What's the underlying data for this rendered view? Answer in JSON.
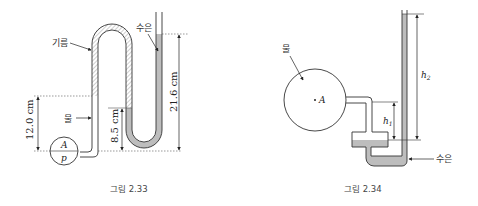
{
  "figures": [
    {
      "caption": "그림 2.33",
      "labels": {
        "air": "기름",
        "water": "물",
        "mercury": "수은",
        "point": "A",
        "pressure": "p"
      },
      "dimensions": {
        "left_height": "12.0 cm",
        "middle_height": "8.5 cm",
        "right_height": "21.6 cm"
      }
    },
    {
      "caption": "그림 2.34",
      "labels": {
        "water": "물",
        "mercury": "수은",
        "point": "A"
      },
      "dimensions": {
        "h1": "h",
        "h1_sub": "1",
        "h2": "h",
        "h2_sub": "2"
      }
    }
  ],
  "colors": {
    "line": "#333333",
    "mercury_fill": "#bdbdbd",
    "hatch": "#888888",
    "dotted": "#555555"
  }
}
